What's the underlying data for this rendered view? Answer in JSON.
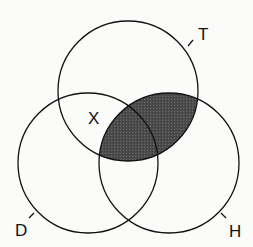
{
  "diagram": {
    "type": "venn-3",
    "sets": [
      {
        "id": "T",
        "label": "T"
      },
      {
        "id": "D",
        "label": "D"
      },
      {
        "id": "H",
        "label": "H"
      }
    ],
    "region_labels": [
      {
        "region": "T∩D only",
        "label": "X"
      }
    ],
    "shaded_region": "T∩H",
    "colors": {
      "stroke": "#111111",
      "shade": "#505050",
      "background": "#fbfbfa"
    }
  }
}
